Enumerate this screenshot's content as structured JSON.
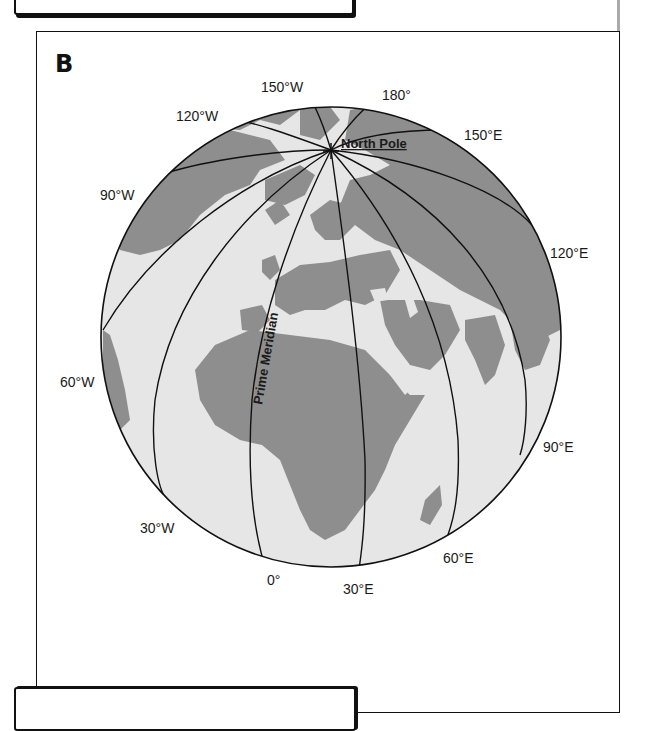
{
  "figure": {
    "panel_label": "B",
    "colors": {
      "ocean": "#e6e6e6",
      "land": "#8e8e8e",
      "lines": "#111111",
      "background": "#ffffff"
    }
  },
  "labels": {
    "north_pole": "North Pole",
    "prime_meridian": "Prime Meridian"
  },
  "meridians": [
    {
      "id": "150W",
      "label": "150°W"
    },
    {
      "id": "180",
      "label": "180°"
    },
    {
      "id": "150E",
      "label": "150°E"
    },
    {
      "id": "120W",
      "label": "120°W"
    },
    {
      "id": "90W",
      "label": "90°W"
    },
    {
      "id": "120E",
      "label": "120°E"
    },
    {
      "id": "60W",
      "label": "60°W"
    },
    {
      "id": "90E",
      "label": "90°E"
    },
    {
      "id": "30W",
      "label": "30°W"
    },
    {
      "id": "60E",
      "label": "60°E"
    },
    {
      "id": "0",
      "label": "0°"
    },
    {
      "id": "30E",
      "label": "30°E"
    }
  ]
}
